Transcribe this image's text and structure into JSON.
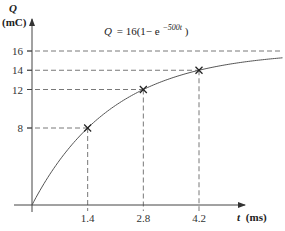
{
  "chart_data": {
    "type": "line",
    "title": "",
    "equation": {
      "lhs": "Q",
      "rhs_prefix": "= 16(1− e",
      "exponent": "−500t",
      "rhs_suffix": ")"
    },
    "xlabel": {
      "symbol": "t",
      "unit": "(ms)"
    },
    "ylabel": {
      "symbol": "Q",
      "unit": "(mC)"
    },
    "xlim": [
      0,
      7.0
    ],
    "ylim": [
      0,
      16
    ],
    "x_ticks": [
      1.4,
      2.8,
      4.2
    ],
    "x_tick_labels": [
      "1.4",
      "2.8",
      "4.2"
    ],
    "y_ticks": [
      8,
      12,
      14,
      16
    ],
    "y_tick_labels": [
      "8",
      "12",
      "14",
      "16"
    ],
    "grid": false,
    "asymptote": 16,
    "series": [
      {
        "name": "Q = 16(1 - e^-500t)",
        "x": [
          0,
          0.35,
          0.7,
          1.05,
          1.4,
          1.75,
          2.1,
          2.45,
          2.8,
          3.15,
          3.5,
          3.85,
          4.2,
          4.55,
          4.9,
          5.25,
          5.6,
          5.95,
          6.3
        ],
        "y": [
          0,
          2.54,
          4.68,
          6.48,
          8.0,
          9.27,
          10.34,
          11.24,
          12.0,
          12.64,
          13.17,
          13.62,
          14.0,
          14.32,
          14.59,
          14.82,
          15.0,
          15.16,
          15.29
        ]
      }
    ],
    "marked_points": [
      {
        "x": 1.4,
        "y": 8
      },
      {
        "x": 2.8,
        "y": 12
      },
      {
        "x": 4.2,
        "y": 14
      }
    ]
  }
}
